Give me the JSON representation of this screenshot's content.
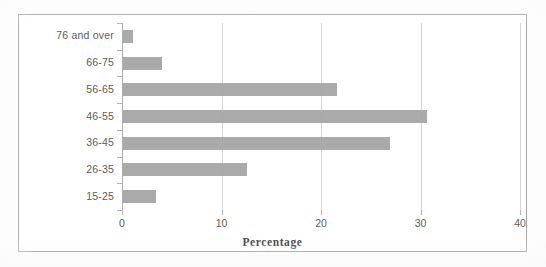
{
  "chart_data": {
    "type": "bar",
    "orientation": "horizontal",
    "title": "",
    "subtitle": "",
    "xlabel": "Percentage",
    "ylabel": "",
    "categories": [
      "15-25",
      "26-35",
      "36-45",
      "46-55",
      "56-65",
      "66-75",
      "76 and over"
    ],
    "values": [
      3.3,
      12.5,
      26.8,
      30.6,
      21.5,
      3.9,
      1.0
    ],
    "series": [
      {
        "name": "Percentage",
        "values": [
          3.3,
          12.5,
          26.8,
          30.6,
          21.5,
          3.9,
          1.0
        ]
      }
    ],
    "xlim": [
      0,
      40
    ],
    "xticks": [
      0,
      10,
      20,
      30,
      40
    ],
    "xtick_labels": [
      "0",
      "10",
      "20",
      "30",
      "40"
    ],
    "ytick_labels": [
      "15-25",
      "26-35",
      "36-45",
      "46-55",
      "56-65",
      "66-75",
      "76 and over"
    ],
    "grid": "vertical",
    "legend": "none",
    "annotations": [],
    "bar_color": "#a3a3a3",
    "gridline_color": "#d6d6d6",
    "axis_color": "#adadad",
    "text_color": "#5c5c5c",
    "frame_color": "#9a9a9a",
    "background_color": "#ffffff"
  },
  "axis": {
    "x_title": "Percentage",
    "ticks": [
      {
        "label": "0",
        "value": 0
      },
      {
        "label": "10",
        "value": 10
      },
      {
        "label": "20",
        "value": 20
      },
      {
        "label": "30",
        "value": 30
      },
      {
        "label": "40",
        "value": 40
      }
    ]
  },
  "bars": [
    {
      "label": "76 and over",
      "value": 1.0
    },
    {
      "label": "66-75",
      "value": 3.9
    },
    {
      "label": "56-65",
      "value": 21.5
    },
    {
      "label": "46-55",
      "value": 30.6
    },
    {
      "label": "36-45",
      "value": 26.8
    },
    {
      "label": "26-35",
      "value": 12.5
    },
    {
      "label": "15-25",
      "value": 3.3
    }
  ]
}
